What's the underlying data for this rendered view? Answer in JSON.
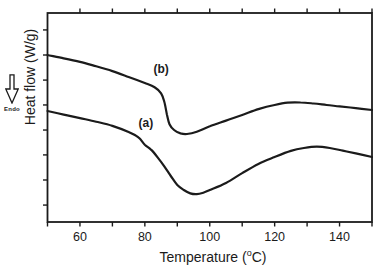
{
  "figure": {
    "background": "#ffffff",
    "ink": "#1b1b1b"
  },
  "y_axis": {
    "title": "Heat flow (W/g)",
    "endo_label": "Endo"
  },
  "x_axis": {
    "title_pre": "Temperature (",
    "title_sup": "o",
    "title_post": "C)"
  },
  "chart_data": {
    "type": "line",
    "title": "",
    "xlabel": "Temperature (°C)",
    "ylabel": "Heat flow (W/g)",
    "y_units": "arbitrary units, no numeric y tick labels; Endo arrow points down",
    "x_range": [
      50,
      150
    ],
    "x_major_ticks": [
      60,
      80,
      100,
      120,
      140
    ],
    "x_minor_tick_step": 10,
    "y_tick_positions_norm": [
      0.081,
      0.201,
      0.321,
      0.44,
      0.56,
      0.679,
      0.799,
      0.919
    ],
    "grid": false,
    "legend": "none (curves labeled inline)",
    "series": [
      {
        "name": "(a)",
        "description": "lower curve: gentle decline, broad endothermic dip with minimum near 95 °C, local maximum near 133 °C",
        "points": [
          [
            50,
            0.531
          ],
          [
            55,
            0.514
          ],
          [
            60,
            0.497
          ],
          [
            65,
            0.48
          ],
          [
            70,
            0.46
          ],
          [
            75,
            0.43
          ],
          [
            78,
            0.405
          ],
          [
            80,
            0.37
          ],
          [
            82,
            0.345
          ],
          [
            84,
            0.308
          ],
          [
            86,
            0.266
          ],
          [
            88,
            0.22
          ],
          [
            90,
            0.177
          ],
          [
            92,
            0.153
          ],
          [
            94,
            0.137
          ],
          [
            96,
            0.133
          ],
          [
            98,
            0.14
          ],
          [
            100,
            0.153
          ],
          [
            105,
            0.187
          ],
          [
            110,
            0.234
          ],
          [
            115,
            0.278
          ],
          [
            120,
            0.311
          ],
          [
            125,
            0.34
          ],
          [
            129,
            0.354
          ],
          [
            133,
            0.361
          ],
          [
            137,
            0.354
          ],
          [
            141,
            0.341
          ],
          [
            145,
            0.328
          ],
          [
            150,
            0.311
          ]
        ]
      },
      {
        "name": "(b)",
        "description": "upper curve: gentle decline, sharp step drop near 86 °C, shallow minimum near 92 °C, broad maximum near 126 °C",
        "points": [
          [
            50,
            0.799
          ],
          [
            55,
            0.783
          ],
          [
            60,
            0.766
          ],
          [
            65,
            0.745
          ],
          [
            70,
            0.722
          ],
          [
            75,
            0.694
          ],
          [
            80,
            0.665
          ],
          [
            83,
            0.645
          ],
          [
            85,
            0.616
          ],
          [
            86,
            0.575
          ],
          [
            86.8,
            0.515
          ],
          [
            87.6,
            0.468
          ],
          [
            89,
            0.44
          ],
          [
            91,
            0.424
          ],
          [
            93,
            0.421
          ],
          [
            96,
            0.432
          ],
          [
            100,
            0.458
          ],
          [
            105,
            0.485
          ],
          [
            110,
            0.512
          ],
          [
            115,
            0.54
          ],
          [
            120,
            0.56
          ],
          [
            124,
            0.571
          ],
          [
            128,
            0.572
          ],
          [
            132,
            0.567
          ],
          [
            136,
            0.56
          ],
          [
            140,
            0.553
          ],
          [
            145,
            0.545
          ],
          [
            150,
            0.536
          ]
        ]
      }
    ],
    "annotations": [
      {
        "text": "(a)",
        "t": 80.3,
        "v": 0.474
      },
      {
        "text": "(b)",
        "t": 85.0,
        "v": 0.732
      }
    ]
  }
}
